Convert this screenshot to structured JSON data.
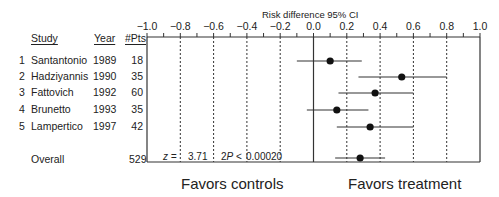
{
  "chart_data": {
    "type": "forest",
    "title": "Risk difference 95% CI",
    "xlabel": "Risk difference 95% CI",
    "xlim": [
      -1.0,
      1.0
    ],
    "x_ticks": [
      "-1.0",
      "-0.8",
      "-0.6",
      "-0.4",
      "-0.2",
      "0.0",
      "0.2",
      "0.4",
      "0.6",
      "0.8",
      "1.0"
    ],
    "x_tick_values": [
      -1.0,
      -0.8,
      -0.6,
      -0.4,
      -0.2,
      0.0,
      0.2,
      0.4,
      0.6,
      0.8,
      1.0
    ],
    "gridlines": "dashed at -0.8,-0.6,-0.4,-0.2,0.2,0.4,0.6,0.8; solid at 0.0",
    "columns": [
      "Study",
      "Year",
      "#Pts"
    ],
    "studies": [
      {
        "index": "1",
        "name": "Santantonio",
        "year": "1989",
        "pts": "18",
        "estimate": 0.1,
        "ci_low": -0.1,
        "ci_high": 0.29
      },
      {
        "index": "2",
        "name": "Hadziyannis",
        "year": "1990",
        "pts": "35",
        "estimate": 0.53,
        "ci_low": 0.27,
        "ci_high": 0.8
      },
      {
        "index": "3",
        "name": "Fattovich",
        "year": "1992",
        "pts": "60",
        "estimate": 0.37,
        "ci_low": 0.15,
        "ci_high": 0.6
      },
      {
        "index": "4",
        "name": "Brunetto",
        "year": "1993",
        "pts": "35",
        "estimate": 0.14,
        "ci_low": -0.04,
        "ci_high": 0.33
      },
      {
        "index": "5",
        "name": "Lampertico",
        "year": "1997",
        "pts": "42",
        "estimate": 0.34,
        "ci_low": 0.14,
        "ci_high": 0.6
      }
    ],
    "overall": {
      "name": "Overall",
      "pts": "529",
      "estimate": 0.28,
      "ci_low": 0.13,
      "ci_high": 0.43
    },
    "statistics": {
      "z_label": "z =",
      "z_value": "3.71",
      "p_label": "2P <",
      "p_value": "0.00020"
    },
    "annotations": {
      "left": "Favors controls",
      "right": "Favors treatment"
    }
  },
  "table": {
    "headers": {
      "study": "Study",
      "year": "Year",
      "pts": "#Pts"
    }
  }
}
